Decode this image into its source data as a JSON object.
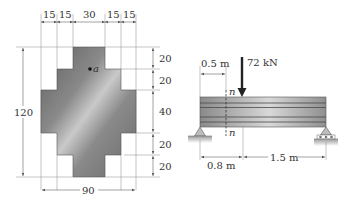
{
  "cross_section": {
    "top_widths_labels": [
      "15",
      "15",
      "30",
      "15",
      "15"
    ],
    "height_label": "120",
    "width_label": "90",
    "right_heights_labels": [
      "20",
      "20",
      "40",
      "20",
      "20"
    ],
    "point_label": "a"
  },
  "beam": {
    "load_label": "72 kN",
    "section_top_label": "n",
    "section_bottom_label": "n",
    "section_distance_label": "0.5 m",
    "load_distance_label": "0.8 m",
    "remaining_span_label": "1.5 m",
    "left_support": "pin",
    "right_support": "roller"
  },
  "colors": {
    "section_fill_dark": "#6e6e6e",
    "section_fill_light": "#c8c8c8",
    "beam_fill": "#a0a0a0",
    "line": "#555555"
  }
}
